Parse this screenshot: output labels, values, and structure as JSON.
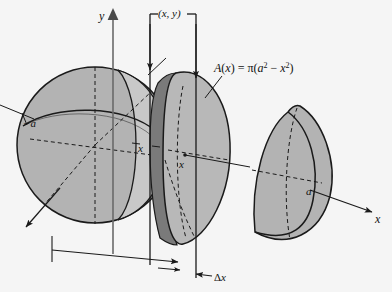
{
  "figure": {
    "name": "sphere-cross-section-diagram",
    "caption_formula": "A(x) = π(a² − x²)",
    "axes": {
      "y_label": "y",
      "x_label": "x"
    },
    "labels": {
      "point_xy": "(x, y)",
      "neg_a": "−a",
      "pos_a": "a",
      "x_left": "x",
      "x_right": "x",
      "delta_x": "Δx",
      "area_formula": "A(x) = π(a² − x²)"
    },
    "colors": {
      "background": "#f5f5f5",
      "sphere_fill": "#b3b3b3",
      "crescent_fill": "#c8c8c8",
      "slab_rim": "#7a7a7a",
      "slab_face": "#b8b8b8",
      "stroke": "#1a1a1a",
      "text": "#111111"
    },
    "elements": {
      "left_sphere": "left-sphere",
      "middle_slab": "middle-slab-disk",
      "right_cap": "right-spherical-cap"
    }
  }
}
